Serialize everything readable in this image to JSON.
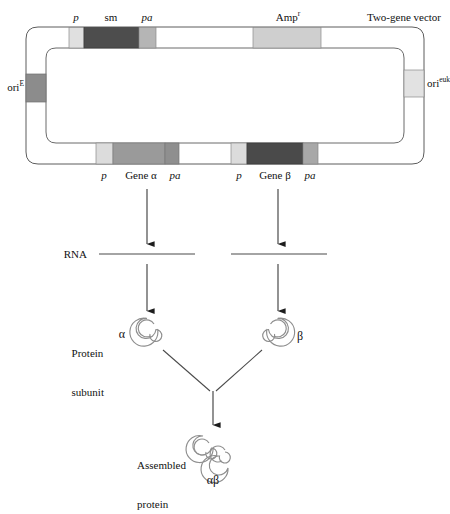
{
  "figure": {
    "vector_label": "Two-gene vector"
  },
  "colors": {
    "outline": "#5a5a5a",
    "segment_dark": "#4d4d4d",
    "segment_dark2": "#404040",
    "segment_mid": "#909090",
    "segment_midgray": "#8a8a8a",
    "segment_light": "#d9d9d9",
    "segment_lightgray": "#cfcfcf",
    "segment_pale": "#e6e6e6",
    "background": "#ffffff",
    "text": "#111111",
    "arrow": "#6b6b6b",
    "coil": "#8c8c8c"
  },
  "plasmid": {
    "top_strand": {
      "segments": [
        {
          "name": "p",
          "label": "p",
          "italic": true,
          "fill": "#e0e0e0"
        },
        {
          "name": "sm",
          "label": "sm",
          "italic": false,
          "fill": "#4d4d4d"
        },
        {
          "name": "pa",
          "label": "pa",
          "italic": true,
          "fill": "#b5b5b5"
        },
        {
          "name": "spacer",
          "label": "",
          "italic": false,
          "fill": "#ffffff"
        },
        {
          "name": "ampr",
          "label": "Amp",
          "superscript": "r",
          "italic": false,
          "fill": "#cfcfcf"
        },
        {
          "name": "spacer2",
          "label": "",
          "italic": false,
          "fill": "#ffffff"
        }
      ]
    },
    "bottom_strand": {
      "segments": [
        {
          "name": "p-alpha",
          "label": "p",
          "italic": true,
          "fill": "#dcdcdc"
        },
        {
          "name": "gene-alpha",
          "label": "Gene α",
          "italic": false,
          "fill": "#9a9a9a"
        },
        {
          "name": "pa-alpha",
          "label": "pa",
          "italic": true,
          "fill": "#8f8f8f"
        },
        {
          "name": "spacer",
          "label": "",
          "italic": false,
          "fill": "#ffffff"
        },
        {
          "name": "p-beta",
          "label": "p",
          "italic": true,
          "fill": "#dcdcdc"
        },
        {
          "name": "gene-beta",
          "label": "Gene β",
          "italic": false,
          "fill": "#4a4a4a"
        },
        {
          "name": "pa-beta",
          "label": "pa",
          "italic": true,
          "fill": "#a8a8a8"
        }
      ]
    },
    "left_origin": {
      "label": "ori",
      "superscript": "E",
      "fill": "#8c8c8c"
    },
    "right_origin": {
      "label": "ori",
      "superscript": "euk",
      "fill": "#e2e2e2"
    }
  },
  "stages": {
    "rna": {
      "label": "RNA",
      "transcripts": [
        {
          "name": "rna-alpha"
        },
        {
          "name": "rna-beta"
        }
      ]
    },
    "protein_subunit": {
      "label_line1": "Protein",
      "label_line2": "subunit",
      "subunits": [
        {
          "name": "subunit-alpha",
          "label": "α",
          "label_side": "left"
        },
        {
          "name": "subunit-beta",
          "label": "β",
          "label_side": "right"
        }
      ]
    },
    "assembled": {
      "label_line1": "Assembled",
      "label_line2": "protein",
      "complex_label": "αβ"
    }
  }
}
